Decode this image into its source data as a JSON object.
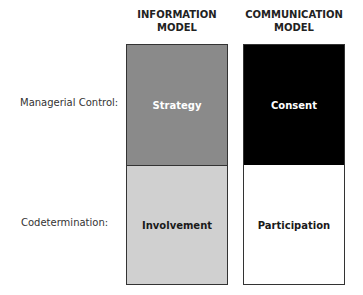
{
  "columns": [
    {
      "title_line1": "INFORMATION",
      "title_line2": "MODEL"
    },
    {
      "title_line1": "COMMUNICATION",
      "title_line2": "MODEL"
    }
  ],
  "rows": [
    {
      "label": "Managerial Control:"
    },
    {
      "label": "Codetermination:"
    }
  ],
  "cells": {
    "info_control": {
      "text": "Strategy",
      "bg": "#8a8a8a",
      "color": "#ffffff"
    },
    "info_codet": {
      "text": "Involvement",
      "bg": "#d0d0d0",
      "color": "#1a1a1a"
    },
    "comm_control": {
      "text": "Consent",
      "bg": "#000000",
      "color": "#ffffff"
    },
    "comm_codet": {
      "text": "Participation",
      "bg": "#ffffff",
      "color": "#1a1a1a"
    }
  }
}
